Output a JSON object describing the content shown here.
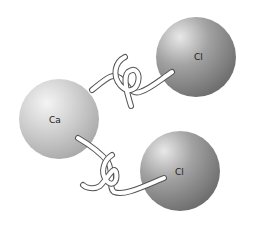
{
  "diagram": {
    "type": "ionic-bond-illustration",
    "atoms": [
      {
        "id": "ca",
        "label": "Ca",
        "color": "#c8c8c8"
      },
      {
        "id": "cl1",
        "label": "Cl",
        "color": "#8a8a8a"
      },
      {
        "id": "cl2",
        "label": "Cl",
        "color": "#8a8a8a"
      }
    ],
    "bonds": [
      {
        "from": "ca",
        "to": "cl1",
        "style": "interlocking-hooks"
      },
      {
        "from": "ca",
        "to": "cl2",
        "style": "interlocking-hooks"
      }
    ]
  }
}
